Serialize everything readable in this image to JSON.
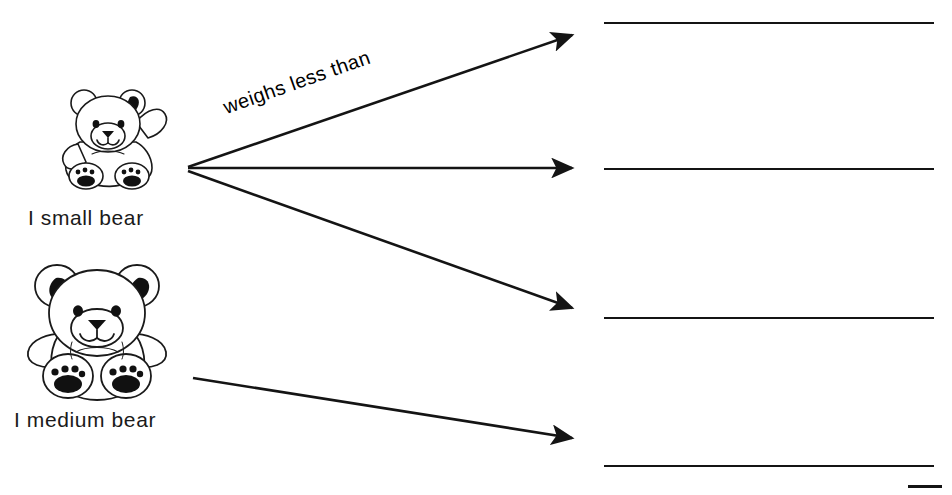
{
  "page": {
    "background_color": "#ffffff",
    "ink_color": "#141414",
    "width": 952,
    "height": 495
  },
  "prompts": [
    {
      "id": "small-bear",
      "icon": "teddy-bear-small-icon",
      "caption": "I small bear"
    },
    {
      "id": "medium-bear",
      "icon": "teddy-bear-medium-icon",
      "caption": "I medium bear"
    }
  ],
  "relations": [
    {
      "id": "weighs-less-than",
      "label": "weighs less than"
    }
  ],
  "arrows": [
    {
      "id": "arrow-1",
      "from": "small-bear",
      "x1": 188,
      "y1": 167,
      "x2": 580,
      "y2": 32
    },
    {
      "id": "arrow-2",
      "from": "small-bear",
      "x1": 188,
      "y1": 168,
      "x2": 580,
      "y2": 168
    },
    {
      "id": "arrow-3",
      "from": "small-bear",
      "x1": 188,
      "y1": 171,
      "x2": 580,
      "y2": 311
    },
    {
      "id": "arrow-4",
      "from": "medium-bear",
      "x1": 193,
      "y1": 378,
      "x2": 580,
      "y2": 440
    }
  ],
  "answer_lines": [
    {
      "id": "answer-line-1",
      "x": 604,
      "y": 22,
      "width": 330
    },
    {
      "id": "answer-line-2",
      "x": 604,
      "y": 168,
      "width": 330
    },
    {
      "id": "answer-line-3",
      "x": 604,
      "y": 317,
      "width": 330
    },
    {
      "id": "answer-line-4",
      "x": 604,
      "y": 465,
      "width": 330
    }
  ],
  "partial_marks": [
    {
      "id": "partial-edge-mark",
      "x": 908,
      "y": 485,
      "width": 34
    }
  ]
}
